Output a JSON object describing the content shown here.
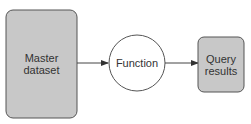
{
  "diagram": {
    "nodes": [
      {
        "id": "master",
        "shape": "rounded-rect",
        "label": "Master\ndataset",
        "fill": "#c8c8c8",
        "stroke": "#555555"
      },
      {
        "id": "function",
        "shape": "circle",
        "label": "Function",
        "fill": "#ffffff",
        "stroke": "#555555"
      },
      {
        "id": "query",
        "shape": "rounded-rect",
        "label": "Query\nresults",
        "fill": "#c8c8c8",
        "stroke": "#555555"
      }
    ],
    "edges": [
      {
        "from": "master",
        "to": "function"
      },
      {
        "from": "function",
        "to": "query"
      }
    ]
  }
}
